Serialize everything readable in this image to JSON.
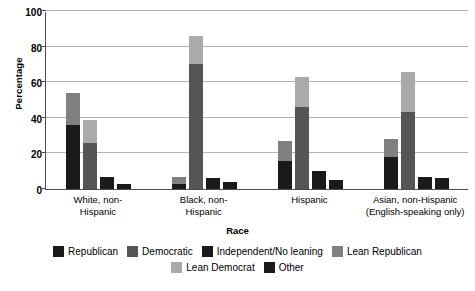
{
  "chart_data": {
    "type": "bar",
    "title": "",
    "xlabel": "Race",
    "ylabel": "Percentage",
    "ylim": [
      0,
      100
    ],
    "yticks": [
      0,
      20,
      40,
      60,
      80,
      100
    ],
    "grid": true,
    "stacked": true,
    "legend_position": "bottom",
    "categories": [
      "White, non-Hispanic",
      "Black, non-Hispanic",
      "Hispanic",
      "Asian, non-Hispanic (English-speaking only)"
    ],
    "category_lines": [
      [
        "White, non-",
        "Hispanic"
      ],
      [
        "Black, non-",
        "Hispanic"
      ],
      [
        "Hispanic"
      ],
      [
        "Asian, non-Hispanic",
        "(English-speaking only)"
      ]
    ],
    "series": [
      {
        "name": "Republican",
        "values": [
          36,
          3,
          16,
          18
        ]
      },
      {
        "name": "Lean Republican",
        "values": [
          18,
          4,
          11,
          10
        ]
      },
      {
        "name": "Democratic",
        "values": [
          26,
          70,
          46,
          43
        ]
      },
      {
        "name": "Lean Democrat",
        "values": [
          13,
          16,
          17,
          23
        ]
      },
      {
        "name": "Independent/No leaning",
        "values": [
          7,
          6,
          10,
          7
        ]
      },
      {
        "name": "Other",
        "values": [
          3,
          4,
          5,
          6
        ]
      }
    ],
    "bars": [
      {
        "label": "Republican",
        "totals": [
          54,
          7,
          27,
          28
        ]
      },
      {
        "label": "Democratic",
        "totals": [
          39,
          86,
          63,
          66
        ]
      },
      {
        "label": "Independent/No leaning",
        "totals": [
          7,
          6,
          10,
          7
        ]
      },
      {
        "label": "Other",
        "totals": [
          3,
          4,
          5,
          6
        ]
      }
    ]
  },
  "legend": {
    "rows": [
      [
        {
          "label": "Republican",
          "color": "#1a1a1a",
          "key": "republican"
        },
        {
          "label": "Democratic",
          "color": "#555555",
          "key": "democratic"
        },
        {
          "label": "Independent/No leaning",
          "color": "#1a1a1a",
          "key": "independent"
        },
        {
          "label": "Lean Republican",
          "color": "#808080",
          "key": "lean-republican"
        }
      ],
      [
        {
          "label": "Lean Democrat",
          "color": "#aaaaaa",
          "key": "lean-democrat"
        },
        {
          "label": "Other",
          "color": "#1a1a1a",
          "key": "other"
        }
      ]
    ]
  },
  "colors": {
    "republican": "#1a1a1a",
    "lean_republican": "#808080",
    "democratic": "#555555",
    "lean_democrat": "#aaaaaa",
    "independent": "#1a1a1a",
    "other": "#1a1a1a",
    "grid": "#b3b3b3",
    "axis": "#4d4d4d",
    "background": "#ffffff"
  }
}
